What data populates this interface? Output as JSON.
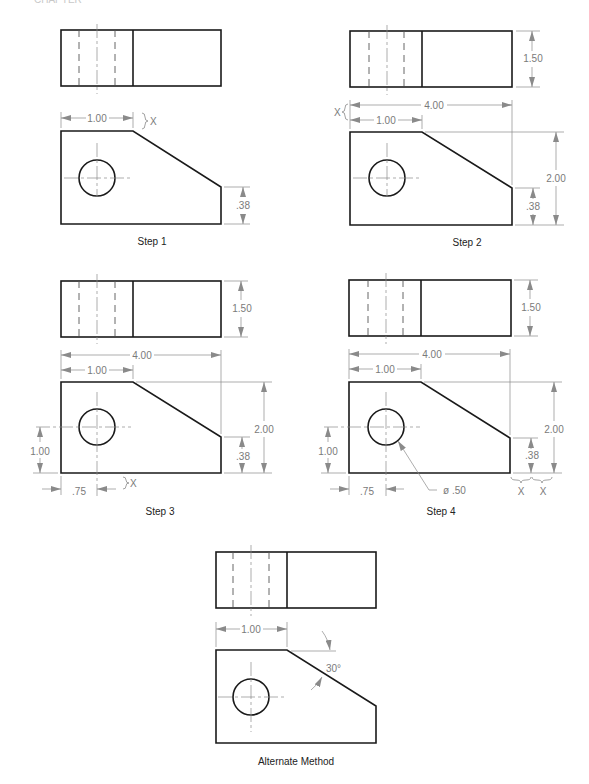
{
  "header": {
    "partial_label": "CHAPTER"
  },
  "footer": {
    "partial_text": "Figure caption (cut off)"
  },
  "panels": [
    {
      "id": "step1",
      "caption": "Step 1",
      "dims": {
        "width_top": "1.00",
        "right_height": ".38",
        "x_label": "X"
      }
    },
    {
      "id": "step2",
      "caption": "Step 2",
      "dims": {
        "overall_width": "4.00",
        "width_top": "1.00",
        "depth": "1.50",
        "overall_height": "2.00",
        "right_height": ".38",
        "x_label": "X"
      }
    },
    {
      "id": "step3",
      "caption": "Step 3",
      "dims": {
        "overall_width": "4.00",
        "width_top": "1.00",
        "depth": "1.50",
        "overall_height": "2.00",
        "right_height": ".38",
        "hole_height": "1.00",
        "hole_offset": ".75",
        "x_label": "X"
      }
    },
    {
      "id": "step4",
      "caption": "Step 4",
      "dims": {
        "overall_width": "4.00",
        "width_top": "1.00",
        "depth": "1.50",
        "overall_height": "2.00",
        "right_height": ".38",
        "hole_height": "1.00",
        "hole_offset": ".75",
        "hole_diameter": "ø .50",
        "x_label_1": "X",
        "x_label_2": "X"
      }
    },
    {
      "id": "alternate",
      "caption": "Alternate Method",
      "dims": {
        "width_top": "1.00",
        "angle": "30°"
      }
    }
  ],
  "colors": {
    "object_line": "#1a1a1a",
    "dimension_line": "#8a8a8a",
    "dimension_text": "#7a7a7a",
    "background": "#ffffff"
  }
}
